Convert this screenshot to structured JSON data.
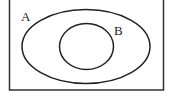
{
  "diagram": {
    "type": "venn",
    "universe": {
      "label": ""
    },
    "sets": [
      {
        "id": "A",
        "label": "A",
        "contains": [
          "B"
        ]
      },
      {
        "id": "B",
        "label": "B",
        "subset_of": "A"
      }
    ],
    "stroke_color": "#222222",
    "background_color": "#ffffff"
  }
}
